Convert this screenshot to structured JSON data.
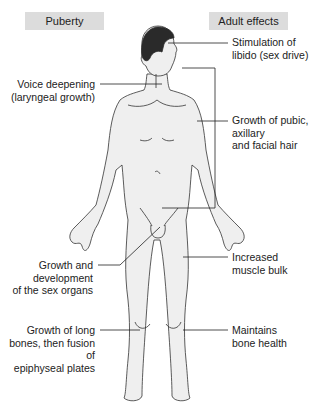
{
  "headers": {
    "left": "Puberty",
    "right": "Adult effects"
  },
  "labels": {
    "libido_1": "Stimulation of",
    "libido_2": "libido (sex drive)",
    "voice_1": "Voice deepening",
    "voice_2": "(laryngeal growth)",
    "hair_1": "Growth of pubic,",
    "hair_2": "axillary",
    "hair_3": "and facial hair",
    "sex_1": "Growth and",
    "sex_2": "development",
    "sex_3": "of the sex organs",
    "muscle_1": "Increased",
    "muscle_2": "muscle bulk",
    "bone_1": "Growth of long",
    "bone_2": "bones, then fusion of",
    "bone_3": "epiphyseal plates",
    "health_1": "Maintains",
    "health_2": "bone health"
  },
  "colors": {
    "header_bg": "#dcdcdc",
    "body_fill": "#efefef",
    "outline": "#333333",
    "hair": "#2a2a2a"
  }
}
